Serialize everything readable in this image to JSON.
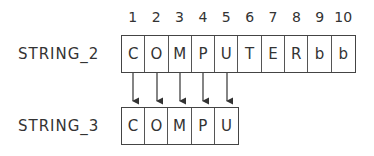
{
  "indices": [
    "1",
    "2",
    "3",
    "4",
    "5",
    "6",
    "7",
    "8",
    "9",
    "10"
  ],
  "string2": {
    "label": "STRING_2",
    "cells": [
      "C",
      "O",
      "M",
      "P",
      "U",
      "T",
      "E",
      "R",
      "b",
      "b"
    ]
  },
  "string3": {
    "label": "STRING_3",
    "cells": [
      "C",
      "O",
      "M",
      "P",
      "U"
    ]
  },
  "arrows": {
    "count": 5,
    "direction": "down",
    "from": "STRING_2",
    "to": "STRING_3"
  }
}
